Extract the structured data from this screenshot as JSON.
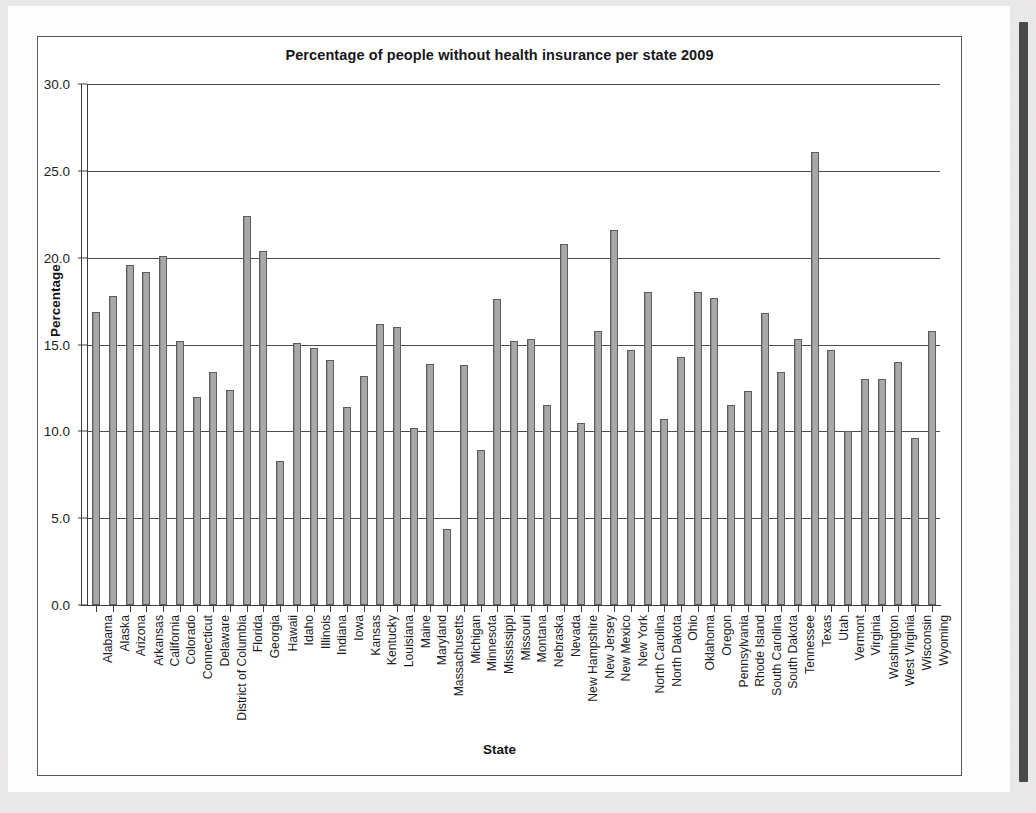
{
  "window": {
    "background_color": "#ebe9e9",
    "panel_color": "#fdfdfd",
    "scrollbar_color": "#4a4a4a"
  },
  "chart_data": {
    "type": "bar",
    "title": "Percentage of people without health insurance per state 2009",
    "xlabel": "State",
    "ylabel": "Percentage",
    "ylim": [
      0.0,
      30.0
    ],
    "yticks": [
      "0.0",
      "5.0",
      "10.0",
      "15.0",
      "20.0",
      "25.0",
      "30.0"
    ],
    "ytick_values": [
      0.0,
      5.0,
      10.0,
      15.0,
      20.0,
      25.0,
      30.0
    ],
    "grid": true,
    "legend": "none",
    "bar_color": "#a8a8a8",
    "bar_edge_color": "#5d5d5f",
    "categories": [
      "Alabama",
      "Alaska",
      "Arizona",
      "Arkansas",
      "California",
      "Colorado",
      "Connecticut",
      "Delaware",
      "District of Columbia",
      "Florida",
      "Georgia",
      "Hawaii",
      "Idaho",
      "Illinois",
      "Indiana",
      "Iowa",
      "Kansas",
      "Kentucky",
      "Louisiana",
      "Maine",
      "Maryland",
      "Massachusetts",
      "Michigan",
      "Minnesota",
      "Mississippi",
      "Missouri",
      "Montana",
      "Nebraska",
      "Nevada",
      "New Hampshire",
      "New Jersey",
      "New Mexico",
      "New York",
      "North Carolina",
      "North Dakota",
      "Ohio",
      "Oklahoma",
      "Oregon",
      "Pennsylvania",
      "Rhode Island",
      "South Carolina",
      "South Dakota",
      "Tennessee",
      "Texas",
      "Utah",
      "Vermont",
      "Virginia",
      "Washington",
      "West Virginia",
      "Wisconsin",
      "Wyoming"
    ],
    "values": [
      16.9,
      17.8,
      19.6,
      19.2,
      20.1,
      15.2,
      12.0,
      13.4,
      12.4,
      22.4,
      20.4,
      8.3,
      15.1,
      14.8,
      14.1,
      11.4,
      13.2,
      16.2,
      16.0,
      10.2,
      13.9,
      4.4,
      13.8,
      8.9,
      17.6,
      15.2,
      15.3,
      11.5,
      20.8,
      10.5,
      15.8,
      21.6,
      14.7,
      18.0,
      10.7,
      14.3,
      18.0,
      17.7,
      11.5,
      12.3,
      16.8,
      13.4,
      15.3,
      26.1,
      14.7,
      10.0,
      13.0,
      13.0,
      14.0,
      9.6,
      15.8
    ]
  }
}
